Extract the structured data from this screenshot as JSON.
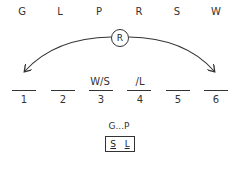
{
  "letters": [
    "G",
    "L",
    "P",
    "R",
    "S",
    "W"
  ],
  "arc": {
    "label": "R",
    "from_slot": 6,
    "to_slot": 1,
    "direction": "both-ends"
  },
  "slots": [
    {
      "number": "1",
      "annotation": ""
    },
    {
      "number": "2",
      "annotation": ""
    },
    {
      "number": "3",
      "annotation": "W/S"
    },
    {
      "number": "4",
      "annotation": "/L"
    },
    {
      "number": "5",
      "annotation": ""
    },
    {
      "number": "6",
      "annotation": ""
    }
  ],
  "rules": {
    "sequence": "G...P",
    "block": [
      "S",
      "L"
    ]
  },
  "colors": {
    "ink": "#333333",
    "background": "#ffffff"
  }
}
